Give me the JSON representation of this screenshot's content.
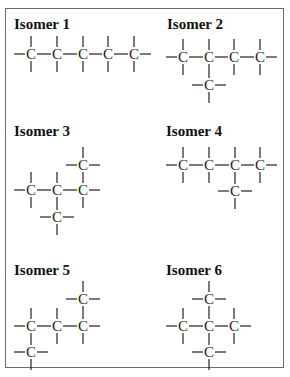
{
  "figure": {
    "frame_color": "#6b6b6b",
    "isomers": [
      {
        "label": "Isomer 1",
        "title_pos": [
          14,
          17
        ],
        "carbons": [
          [
            31,
            54
          ],
          [
            57,
            54
          ],
          [
            83,
            54
          ],
          [
            108,
            54
          ],
          [
            134,
            54
          ]
        ],
        "ext_left": [
          [
            31,
            54
          ]
        ],
        "ext_right": [
          [
            134,
            54
          ]
        ],
        "up": [
          [
            31,
            54
          ],
          [
            57,
            54
          ],
          [
            83,
            54
          ],
          [
            108,
            54
          ],
          [
            134,
            54
          ]
        ],
        "down": [
          [
            31,
            54
          ],
          [
            57,
            54
          ],
          [
            83,
            54
          ],
          [
            108,
            54
          ],
          [
            134,
            54
          ]
        ],
        "hbonds": [
          [
            [
              31,
              54
            ],
            [
              57,
              54
            ]
          ],
          [
            [
              57,
              54
            ],
            [
              83,
              54
            ]
          ],
          [
            [
              83,
              54
            ],
            [
              108,
              54
            ]
          ],
          [
            [
              108,
              54
            ],
            [
              134,
              54
            ]
          ]
        ],
        "vbonds": []
      },
      {
        "label": "Isomer 2",
        "title_pos": [
          167,
          17
        ],
        "carbons": [
          [
            183,
            57
          ],
          [
            209,
            57
          ],
          [
            234,
            57
          ],
          [
            260,
            57
          ],
          [
            209,
            85
          ]
        ],
        "ext_left": [
          [
            183,
            57
          ],
          [
            209,
            85
          ]
        ],
        "ext_right": [
          [
            260,
            57
          ],
          [
            209,
            85
          ]
        ],
        "up": [
          [
            183,
            57
          ],
          [
            209,
            57
          ],
          [
            234,
            57
          ],
          [
            260,
            57
          ]
        ],
        "down": [
          [
            183,
            57
          ],
          [
            234,
            57
          ],
          [
            260,
            57
          ],
          [
            209,
            85
          ]
        ],
        "hbonds": [
          [
            [
              183,
              57
            ],
            [
              209,
              57
            ]
          ],
          [
            [
              209,
              57
            ],
            [
              234,
              57
            ]
          ],
          [
            [
              234,
              57
            ],
            [
              260,
              57
            ]
          ]
        ],
        "vbonds": [
          [
            [
              209,
              57
            ],
            [
              209,
              85
            ]
          ]
        ]
      },
      {
        "label": "Isomer 3",
        "title_pos": [
          14,
          124
        ],
        "carbons": [
          [
            83,
            165
          ],
          [
            31,
            190
          ],
          [
            57,
            190
          ],
          [
            83,
            190
          ],
          [
            57,
            217
          ]
        ],
        "ext_left": [
          [
            83,
            165
          ],
          [
            31,
            190
          ],
          [
            57,
            217
          ]
        ],
        "ext_right": [
          [
            83,
            165
          ],
          [
            83,
            190
          ],
          [
            57,
            217
          ]
        ],
        "up": [
          [
            83,
            165
          ],
          [
            31,
            190
          ],
          [
            57,
            190
          ]
        ],
        "down": [
          [
            31,
            190
          ],
          [
            83,
            190
          ],
          [
            57,
            217
          ]
        ],
        "hbonds": [
          [
            [
              31,
              190
            ],
            [
              57,
              190
            ]
          ],
          [
            [
              57,
              190
            ],
            [
              83,
              190
            ]
          ]
        ],
        "vbonds": [
          [
            [
              83,
              165
            ],
            [
              83,
              190
            ]
          ],
          [
            [
              57,
              190
            ],
            [
              57,
              217
            ]
          ]
        ]
      },
      {
        "label": "Isomer 4",
        "title_pos": [
          166,
          124
        ],
        "carbons": [
          [
            183,
            165
          ],
          [
            209,
            165
          ],
          [
            235,
            165
          ],
          [
            260,
            165
          ],
          [
            235,
            191
          ]
        ],
        "ext_left": [
          [
            183,
            165
          ],
          [
            235,
            191
          ]
        ],
        "ext_right": [
          [
            260,
            165
          ],
          [
            235,
            191
          ]
        ],
        "up": [
          [
            183,
            165
          ],
          [
            209,
            165
          ],
          [
            235,
            165
          ],
          [
            260,
            165
          ]
        ],
        "down": [
          [
            183,
            165
          ],
          [
            209,
            165
          ],
          [
            260,
            165
          ],
          [
            235,
            191
          ]
        ],
        "hbonds": [
          [
            [
              183,
              165
            ],
            [
              209,
              165
            ]
          ],
          [
            [
              209,
              165
            ],
            [
              235,
              165
            ]
          ],
          [
            [
              235,
              165
            ],
            [
              260,
              165
            ]
          ]
        ],
        "vbonds": [
          [
            [
              235,
              165
            ],
            [
              235,
              191
            ]
          ]
        ]
      },
      {
        "label": "Isomer 5",
        "title_pos": [
          14,
          263
        ],
        "carbons": [
          [
            83,
            299
          ],
          [
            31,
            326
          ],
          [
            57,
            326
          ],
          [
            83,
            326
          ],
          [
            31,
            352
          ]
        ],
        "ext_left": [
          [
            83,
            299
          ],
          [
            31,
            326
          ],
          [
            31,
            352
          ]
        ],
        "ext_right": [
          [
            83,
            299
          ],
          [
            83,
            326
          ],
          [
            31,
            352
          ]
        ],
        "up": [
          [
            83,
            299
          ],
          [
            31,
            326
          ],
          [
            57,
            326
          ]
        ],
        "down": [
          [
            57,
            326
          ],
          [
            83,
            326
          ],
          [
            31,
            352
          ]
        ],
        "hbonds": [
          [
            [
              31,
              326
            ],
            [
              57,
              326
            ]
          ],
          [
            [
              57,
              326
            ],
            [
              83,
              326
            ]
          ]
        ],
        "vbonds": [
          [
            [
              83,
              299
            ],
            [
              83,
              326
            ]
          ],
          [
            [
              31,
              326
            ],
            [
              31,
              352
            ]
          ]
        ]
      },
      {
        "label": "Isomer 6",
        "title_pos": [
          166,
          263
        ],
        "carbons": [
          [
            209,
            299
          ],
          [
            183,
            326
          ],
          [
            209,
            326
          ],
          [
            234,
            326
          ],
          [
            209,
            352
          ]
        ],
        "ext_left": [
          [
            209,
            299
          ],
          [
            183,
            326
          ],
          [
            209,
            352
          ]
        ],
        "ext_right": [
          [
            209,
            299
          ],
          [
            234,
            326
          ],
          [
            209,
            352
          ]
        ],
        "up": [
          [
            209,
            299
          ],
          [
            183,
            326
          ],
          [
            234,
            326
          ]
        ],
        "down": [
          [
            183,
            326
          ],
          [
            234,
            326
          ],
          [
            209,
            352
          ]
        ],
        "hbonds": [
          [
            [
              183,
              326
            ],
            [
              209,
              326
            ]
          ],
          [
            [
              209,
              326
            ],
            [
              234,
              326
            ]
          ]
        ],
        "vbonds": [
          [
            [
              209,
              299
            ],
            [
              209,
              326
            ]
          ],
          [
            [
              209,
              326
            ],
            [
              209,
              352
            ]
          ]
        ]
      }
    ],
    "atom_symbol": "C"
  }
}
